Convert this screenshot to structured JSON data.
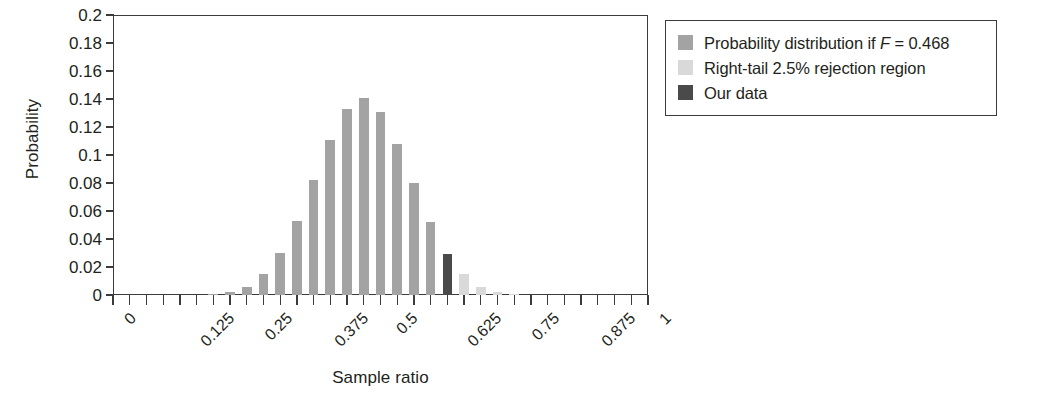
{
  "chart_data": {
    "type": "bar",
    "title": "",
    "xlabel": "Sample ratio",
    "ylabel": "Probability",
    "xlim": [
      0,
      1
    ],
    "ylim": [
      0,
      0.2
    ],
    "grid": false,
    "x_tick_labels": [
      "0",
      "0.125",
      "0.25",
      "0.375",
      "0.5",
      "0.625",
      "0.75",
      "0.875",
      "1"
    ],
    "x_tick_values": [
      0,
      0.125,
      0.25,
      0.375,
      0.5,
      0.625,
      0.75,
      0.875,
      1
    ],
    "y_tick_labels": [
      "0.2",
      "0.18",
      "0.16",
      "0.14",
      "0.12",
      "0.1",
      "0.08",
      "0.06",
      "0.04",
      "0.02",
      "0"
    ],
    "y_tick_values": [
      0.2,
      0.18,
      0.16,
      0.14,
      0.12,
      0.1,
      0.08,
      0.06,
      0.04,
      0.02,
      0
    ],
    "distribution": "Binomial(n=32, F=0.468)",
    "n_trials": 32,
    "F": 0.468,
    "observed_sample_ratio": 0.625,
    "legend_position": "upper right outside",
    "x": [
      0,
      0.03125,
      0.0625,
      0.09375,
      0.125,
      0.15625,
      0.1875,
      0.21875,
      0.25,
      0.28125,
      0.3125,
      0.34375,
      0.375,
      0.40625,
      0.4375,
      0.46875,
      0.5,
      0.53125,
      0.5625,
      0.59375,
      0.625,
      0.65625,
      0.6875,
      0.71875,
      0.75,
      0.78125,
      0.8125,
      0.84375,
      0.875,
      0.90625,
      0.9375,
      0.96875,
      1
    ],
    "categories": [
      "0",
      "1/32",
      "2/32",
      "3/32",
      "4/32",
      "5/32",
      "6/32",
      "7/32",
      "8/32",
      "9/32",
      "10/32",
      "11/32",
      "12/32",
      "13/32",
      "14/32",
      "15/32",
      "16/32",
      "17/32",
      "18/32",
      "19/32",
      "20/32",
      "21/32",
      "22/32",
      "23/32",
      "24/32",
      "25/32",
      "26/32",
      "27/32",
      "28/32",
      "29/32",
      "30/32",
      "31/32",
      "32/32"
    ],
    "values": [
      0.0,
      0.0,
      0.0,
      0.0,
      0.0,
      0.0,
      0.001,
      0.002,
      0.006,
      0.015,
      0.03,
      0.053,
      0.082,
      0.111,
      0.133,
      0.141,
      0.131,
      0.108,
      0.08,
      0.052,
      0.029,
      0.015,
      0.006,
      0.002,
      0.001,
      0.0,
      0.0,
      0.0,
      0.0,
      0.0,
      0.0,
      0.0,
      0.0
    ],
    "bar_classes": [
      "dist",
      "dist",
      "dist",
      "dist",
      "dist",
      "dist",
      "dist",
      "dist",
      "dist",
      "dist",
      "dist",
      "dist",
      "dist",
      "dist",
      "dist",
      "dist",
      "dist",
      "dist",
      "dist",
      "dist",
      "ourdata",
      "rejection",
      "rejection",
      "rejection",
      "rejection",
      "rejection",
      "rejection",
      "rejection",
      "rejection",
      "rejection",
      "rejection",
      "rejection",
      "rejection"
    ],
    "series": [
      {
        "name": "Probability distribution if F = 0.468",
        "color": "#a3a3a3",
        "values": [
          0.0,
          0.0,
          0.0,
          0.0,
          0.0,
          0.0,
          0.001,
          0.002,
          0.006,
          0.015,
          0.03,
          0.053,
          0.082,
          0.111,
          0.133,
          0.141,
          0.131,
          0.108,
          0.08,
          0.052,
          null,
          null,
          null,
          null,
          null,
          null,
          null,
          null,
          null,
          null,
          null,
          null,
          null
        ]
      },
      {
        "name": "Right-tail 2.5% rejection region",
        "color": "#d9d9d9",
        "values": [
          null,
          null,
          null,
          null,
          null,
          null,
          null,
          null,
          null,
          null,
          null,
          null,
          null,
          null,
          null,
          null,
          null,
          null,
          null,
          null,
          null,
          0.015,
          0.006,
          0.002,
          0.001,
          0.0,
          0.0,
          0.0,
          0.0,
          0.0,
          0.0,
          0.0,
          0.0
        ]
      },
      {
        "name": "Our data",
        "color": "#4a4a4a",
        "values": [
          null,
          null,
          null,
          null,
          null,
          null,
          null,
          null,
          null,
          null,
          null,
          null,
          null,
          null,
          null,
          null,
          null,
          null,
          null,
          null,
          0.029,
          null,
          null,
          null,
          null,
          null,
          null,
          null,
          null,
          null,
          null,
          null,
          null
        ]
      }
    ]
  },
  "axes": {
    "y_title": "Probability",
    "x_title": "Sample ratio"
  },
  "legend": {
    "items": [
      {
        "label_prefix": "Probability distribution if ",
        "label_italic": "F",
        "label_suffix": " = 0.468",
        "color": "#a3a3a3"
      },
      {
        "label_prefix": "Right-tail 2.5% rejection region",
        "label_italic": "",
        "label_suffix": "",
        "color": "#d9d9d9"
      },
      {
        "label_prefix": "Our data",
        "label_italic": "",
        "label_suffix": "",
        "color": "#4a4a4a"
      }
    ]
  },
  "colors": {
    "distribution": "#a3a3a3",
    "rejection": "#d9d9d9",
    "our_data": "#4a4a4a",
    "axis": "#3b3b3b",
    "text": "#231f20",
    "background": "#ffffff"
  }
}
